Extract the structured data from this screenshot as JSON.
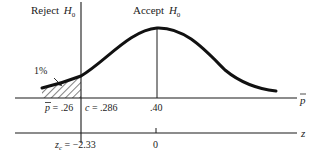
{
  "diagram": {
    "title_left": "Reject",
    "title_left_symbol": "H",
    "title_left_subscript": "0",
    "title_right": "Accept",
    "title_right_symbol": "H",
    "title_right_subscript": "0",
    "tail_area_label": "1%",
    "pbar_axis": {
      "axis_label": "p",
      "observed_label_var": "p",
      "observed_label_value": " = .26",
      "critical_label_var": "c",
      "critical_label_value": " = .286",
      "center_label": ".40"
    },
    "z_axis": {
      "axis_label": "z",
      "critical_label_var": "z",
      "critical_label_sub": "c",
      "critical_label_value": " = −2.33",
      "center_label": "0"
    },
    "colors": {
      "ink": "#1a1a1a",
      "background": "#ffffff"
    }
  }
}
